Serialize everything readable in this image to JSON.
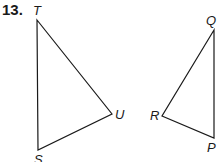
{
  "problem_number": "13.",
  "figures": [
    {
      "name": "triangle-TUS",
      "vertices": [
        {
          "label": "T",
          "x": 37,
          "y": 20
        },
        {
          "label": "U",
          "x": 112,
          "y": 114
        },
        {
          "label": "S",
          "x": 38,
          "y": 150
        }
      ]
    },
    {
      "name": "triangle-QRP",
      "vertices": [
        {
          "label": "Q",
          "x": 214,
          "y": 30
        },
        {
          "label": "R",
          "x": 162,
          "y": 116
        },
        {
          "label": "P",
          "x": 214,
          "y": 138
        }
      ]
    }
  ],
  "colors": {
    "line": "#1a1a1a",
    "background": "#ffffff"
  }
}
